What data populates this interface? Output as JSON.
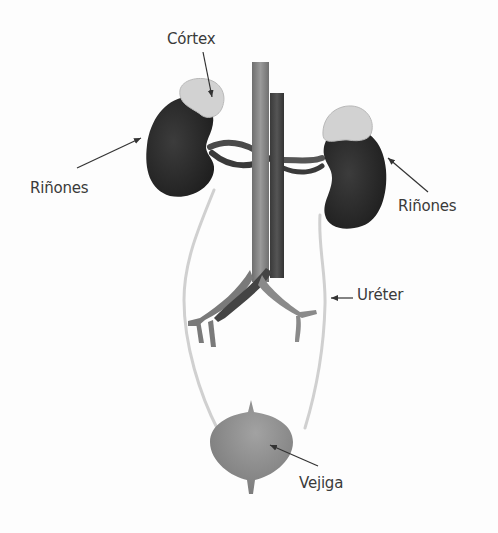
{
  "diagram": {
    "colors": {
      "kidney": "#2e2e2e",
      "cortex": "#d2d2d2",
      "vena_cava": "#8a8a8a",
      "aorta": "#4a4a4a",
      "ureter": "#d0d0d0",
      "bladder": "#8c8c8c",
      "label_text": "#3a3a3a",
      "arrow": "#333333"
    },
    "labels": {
      "cortex": "Córtex",
      "kidneys_left": "Riñones",
      "kidneys_right": "Riñones",
      "ureter": "Uréter",
      "bladder": "Vejiga"
    }
  }
}
